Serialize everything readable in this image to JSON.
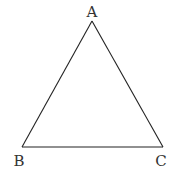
{
  "diagram": {
    "type": "triangle",
    "stroke_color": "#222222",
    "vertices": [
      {
        "label": "A",
        "x": 92,
        "y": 21,
        "label_x": 92,
        "label_y": 17,
        "anchor": "middle"
      },
      {
        "label": "B",
        "x": 22,
        "y": 147,
        "label_x": 19,
        "label_y": 166,
        "anchor": "middle"
      },
      {
        "label": "C",
        "x": 163,
        "y": 147,
        "label_x": 161,
        "label_y": 166,
        "anchor": "middle"
      }
    ],
    "edges": [
      {
        "from": "A",
        "to": "B"
      },
      {
        "from": "B",
        "to": "C"
      },
      {
        "from": "C",
        "to": "A"
      }
    ]
  }
}
